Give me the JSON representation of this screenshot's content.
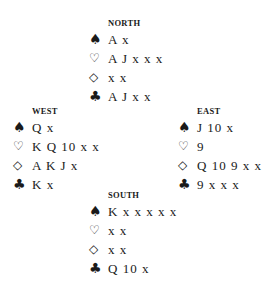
{
  "hands": {
    "north": {
      "title": "NORTH",
      "spades": "A x",
      "hearts": "A J x x x",
      "diamonds": "x x",
      "clubs": "A J x x"
    },
    "west": {
      "title": "WEST",
      "spades": "Q x",
      "hearts": "K Q 10 x x",
      "diamonds": "A K J x",
      "clubs": "K x"
    },
    "east": {
      "title": "EAST",
      "spades": "J 10 x",
      "hearts": "9",
      "diamonds": "Q 10 9 x x",
      "clubs": "9 x x x"
    },
    "south": {
      "title": "SOUTH",
      "spades": "K x x x x x",
      "hearts": "x x",
      "diamonds": "x x",
      "clubs": "Q 10 x"
    }
  },
  "suit_icons": {
    "spades": "♠",
    "hearts": "♡",
    "diamonds": "◇",
    "clubs": "♣"
  }
}
